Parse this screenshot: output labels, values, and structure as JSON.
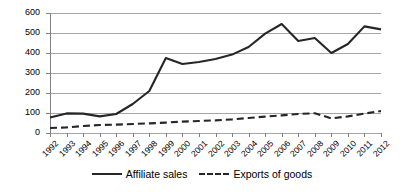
{
  "chart_data": {
    "type": "line",
    "title": "",
    "subtitle": "",
    "xlabel": "",
    "ylabel": "",
    "xlim": [
      1992,
      2012
    ],
    "ylim": [
      0,
      600
    ],
    "ytick_step": 100,
    "grid": true,
    "legend_position": "bottom",
    "categories": [
      "1992",
      "1993",
      "1994",
      "1995",
      "1996",
      "1997",
      "1998",
      "1999",
      "2000",
      "2001",
      "2002",
      "2003",
      "2004",
      "2005",
      "2006",
      "2007",
      "2008",
      "2009",
      "2010",
      "2011",
      "2012"
    ],
    "yticks": [
      "0",
      "100",
      "200",
      "300",
      "400",
      "500",
      "600"
    ],
    "series": [
      {
        "name": "Affiliate sales",
        "style": "solid",
        "color": "#262626",
        "values": [
          78,
          98,
          97,
          83,
          95,
          145,
          210,
          375,
          345,
          355,
          370,
          392,
          430,
          497,
          545,
          460,
          475,
          400,
          445,
          533,
          518
        ]
      },
      {
        "name": "Exports of goods",
        "style": "dashed",
        "color": "#262626",
        "values": [
          25,
          28,
          35,
          40,
          42,
          45,
          48,
          52,
          57,
          60,
          63,
          68,
          75,
          82,
          88,
          95,
          99,
          73,
          83,
          97,
          110
        ]
      }
    ]
  },
  "legend": {
    "items": [
      {
        "label": "Affiliate sales",
        "style": "solid"
      },
      {
        "label": "Exports of goods",
        "style": "dashed"
      }
    ]
  },
  "axis_colors": {
    "gridline": "#a6a6a6",
    "axis": "#808080",
    "series": "#262626"
  }
}
